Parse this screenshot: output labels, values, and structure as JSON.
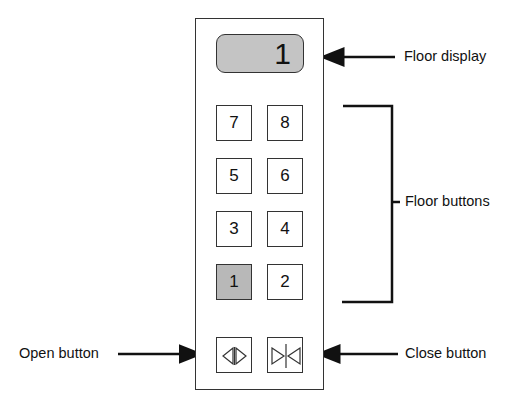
{
  "panel": {
    "display": {
      "value": "1",
      "background": "#c4c4c4"
    },
    "floor_buttons": [
      {
        "label": "7",
        "lit": false
      },
      {
        "label": "8",
        "lit": false
      },
      {
        "label": "5",
        "lit": false
      },
      {
        "label": "6",
        "lit": false
      },
      {
        "label": "3",
        "lit": false
      },
      {
        "label": "4",
        "lit": false
      },
      {
        "label": "1",
        "lit": true
      },
      {
        "label": "2",
        "lit": false
      }
    ],
    "door_buttons": [
      {
        "icon": "door-open-icon"
      },
      {
        "icon": "door-close-icon"
      }
    ]
  },
  "annotations": {
    "floor_display": "Floor display",
    "floor_buttons": "Floor buttons",
    "open_button": "Open button",
    "close_button": "Close button"
  },
  "colors": {
    "lit_button": "#b8b8b8",
    "line": "#111111"
  }
}
